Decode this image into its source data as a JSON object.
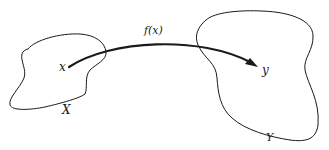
{
  "diagram": {
    "type": "function-mapping",
    "sets": [
      {
        "id": "domain",
        "label": "X"
      },
      {
        "id": "codomain",
        "label": "Y"
      }
    ],
    "points": [
      {
        "id": "x",
        "label": "x",
        "set": "domain"
      },
      {
        "id": "y",
        "label": "y",
        "set": "codomain"
      }
    ],
    "arrow": {
      "from": "x",
      "to": "y",
      "label": "f(x)"
    },
    "colors": {
      "stroke": "#1a1a1a",
      "background": "#ffffff"
    }
  }
}
